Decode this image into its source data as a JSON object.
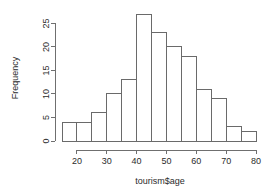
{
  "chart_data": {
    "type": "bar",
    "title": "",
    "subtitle": "",
    "xlabel": "tourism$age",
    "ylabel": "Frequency",
    "categories": [
      "15-20",
      "20-25",
      "25-30",
      "30-35",
      "35-40",
      "40-45",
      "45-50",
      "50-55",
      "55-60",
      "60-65",
      "65-70",
      "70-75",
      "75-80"
    ],
    "bin_edges": [
      15,
      20,
      25,
      30,
      35,
      40,
      45,
      50,
      55,
      60,
      65,
      70,
      75,
      80
    ],
    "bin_width": 5,
    "values": [
      4,
      4,
      6,
      10,
      13,
      27,
      23,
      20,
      18,
      11,
      9,
      3,
      2
    ],
    "xlim": [
      15,
      80
    ],
    "ylim": [
      0,
      27
    ],
    "x_ticks": [
      20,
      30,
      40,
      50,
      60,
      70,
      80
    ],
    "x_tick_labels": [
      "20",
      "30",
      "40",
      "50",
      "60",
      "70",
      "80"
    ],
    "y_ticks": [
      0,
      5,
      10,
      15,
      20,
      25
    ],
    "y_tick_labels": [
      "0",
      "5",
      "10",
      "15",
      "20",
      "25"
    ],
    "grid": false,
    "legend": false,
    "bar_fill": "#ffffff",
    "bar_stroke": "#6a6a6a",
    "axis_color": "#6f6f6f",
    "text_color": "#2b2b2b",
    "background": "#ffffff"
  }
}
